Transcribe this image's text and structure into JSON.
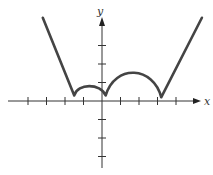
{
  "chart_data": {
    "type": "line",
    "title": "",
    "xlabel": "x",
    "ylabel": "y",
    "grid": false,
    "legend": null,
    "xlim": [
      -5.4,
      5.7
    ],
    "ylim": [
      -3.8,
      5.5
    ],
    "x_ticks": [
      -4,
      -3,
      -2,
      -1,
      1,
      2,
      3,
      4
    ],
    "y_ticks": [
      -3,
      -2,
      -1,
      1,
      2,
      3
    ],
    "tick_labels_shown": false,
    "series": [
      {
        "name": "curve",
        "color": "#444444",
        "points": [
          [
            -3.2,
            4.5
          ],
          [
            -1.5,
            0.3
          ],
          [
            -1.2,
            0.65
          ],
          [
            -0.7,
            0.8
          ],
          [
            -0.2,
            0.65
          ],
          [
            0.2,
            0.3
          ],
          [
            0.6,
            1.05
          ],
          [
            1.2,
            1.45
          ],
          [
            1.8,
            1.55
          ],
          [
            2.4,
            1.4
          ],
          [
            2.9,
            0.9
          ],
          [
            3.2,
            0.2
          ],
          [
            5.4,
            4.5
          ]
        ]
      }
    ]
  },
  "axes": {
    "x_label": "x",
    "y_label": "y"
  }
}
